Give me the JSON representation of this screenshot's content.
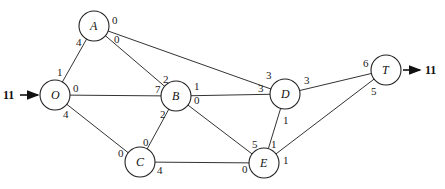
{
  "diagram": {
    "type": "flow-network",
    "nodes": [
      {
        "id": "O",
        "label": "O",
        "x": 55,
        "y": 95
      },
      {
        "id": "A",
        "label": "A",
        "x": 94,
        "y": 26
      },
      {
        "id": "B",
        "label": "B",
        "x": 176,
        "y": 96
      },
      {
        "id": "C",
        "label": "C",
        "x": 140,
        "y": 162
      },
      {
        "id": "D",
        "label": "D",
        "x": 285,
        "y": 94
      },
      {
        "id": "E",
        "label": "E",
        "x": 264,
        "y": 163
      },
      {
        "id": "T",
        "label": "T",
        "x": 386,
        "y": 70
      }
    ],
    "edges": [
      {
        "from": "O",
        "to": "A",
        "cap_from": "1",
        "cap_to": "4"
      },
      {
        "from": "O",
        "to": "B",
        "cap_from": "0",
        "cap_to": "7"
      },
      {
        "from": "O",
        "to": "C",
        "cap_from": "4",
        "cap_to": "0"
      },
      {
        "from": "A",
        "to": "B",
        "cap_from": "0",
        "cap_to": "2"
      },
      {
        "from": "A",
        "to": "D",
        "cap_from": "0",
        "cap_to": "3"
      },
      {
        "from": "B",
        "to": "C",
        "cap_from": "2",
        "cap_to": "0"
      },
      {
        "from": "B",
        "to": "D",
        "cap_from": "1",
        "cap_to": "3"
      },
      {
        "from": "B",
        "to": "E",
        "cap_from": "0",
        "cap_to": "5"
      },
      {
        "from": "C",
        "to": "E",
        "cap_from": "4",
        "cap_to": "0"
      },
      {
        "from": "D",
        "to": "E",
        "cap_from": "1",
        "cap_to": "1"
      },
      {
        "from": "D",
        "to": "T",
        "cap_from": "3",
        "cap_to": "6"
      },
      {
        "from": "E",
        "to": "T",
        "cap_from": "1",
        "cap_to": "5"
      }
    ],
    "source_flow": {
      "label": "11",
      "node": "O"
    },
    "sink_flow": {
      "label": "11",
      "node": "T"
    }
  },
  "labels": {
    "O": "O",
    "A": "A",
    "B": "B",
    "C": "C",
    "D": "D",
    "E": "E",
    "T": "T",
    "in_flow": "11",
    "out_flow": "11",
    "caps": {
      "OA_O": "1",
      "OA_A": "4",
      "OB_O": "0",
      "OB_B": "7",
      "OC_O": "4",
      "OC_C": "0",
      "AB_A": "0",
      "AB_B": "2",
      "AD_A": "0",
      "AD_D": "3",
      "BC_B": "2",
      "BC_C": "0",
      "BD_B": "1",
      "BD_D": "3",
      "BE_B": "0",
      "BE_E": "5",
      "CE_C": "4",
      "CE_E": "0",
      "DE_D": "1",
      "DE_E": "1",
      "DT_D": "3",
      "DT_T": "6",
      "ET_E": "1",
      "ET_T": "5"
    }
  }
}
